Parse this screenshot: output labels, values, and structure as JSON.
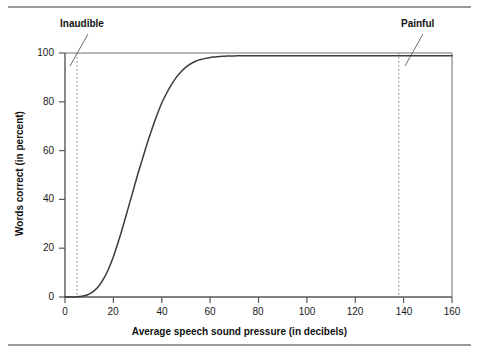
{
  "figure": {
    "background_color": "#ffffff",
    "rule_color": "#9a9a9a",
    "axis_color": "#595959",
    "curve_color": "#3b3b3b",
    "dashed_color": "#9a9a9a"
  },
  "chart_data": {
    "type": "line",
    "title": "",
    "xlabel": "Average speech sound pressure (in decibels)",
    "ylabel": "Words correct (in percent)",
    "xlim": [
      0,
      160
    ],
    "ylim": [
      0,
      100
    ],
    "grid": false,
    "legend": "none",
    "xticks": [
      0,
      20,
      40,
      60,
      80,
      100,
      120,
      140,
      160
    ],
    "xtick_labels": [
      "0",
      "20",
      "40",
      "60",
      "80",
      "100",
      "120",
      "140",
      "160"
    ],
    "yticks": [
      0,
      20,
      40,
      60,
      80,
      100
    ],
    "ytick_labels": [
      "0",
      "20",
      "40",
      "60",
      "80",
      "100"
    ],
    "series": [
      {
        "name": "Speech intelligibility",
        "x": [
          0,
          2,
          4,
          6,
          8,
          10,
          12,
          14,
          16,
          18,
          20,
          22,
          24,
          26,
          28,
          30,
          32,
          34,
          36,
          38,
          40,
          42,
          44,
          46,
          48,
          50,
          52,
          54,
          56,
          58,
          60,
          62,
          64,
          66,
          68,
          70,
          72,
          74,
          76,
          78,
          80,
          90,
          100,
          110,
          120,
          130,
          138,
          140,
          150,
          160
        ],
        "y": [
          0,
          0,
          0,
          0.2,
          0.5,
          1.2,
          2.5,
          4.5,
          7.5,
          11.5,
          16.5,
          22.5,
          29,
          36,
          43,
          50,
          56.5,
          63,
          69,
          74.5,
          79.5,
          83.5,
          87,
          90,
          92.3,
          94.2,
          95.6,
          96.6,
          97.3,
          97.8,
          98.2,
          98.4,
          98.6,
          98.7,
          98.8,
          98.8,
          98.9,
          98.9,
          98.9,
          98.9,
          98.9,
          98.9,
          98.9,
          98.9,
          98.9,
          98.9,
          98.9,
          98.9,
          98.9,
          98.9
        ]
      }
    ],
    "annotations": [
      {
        "label": "Inaudible",
        "x": 5,
        "style": "dashed-vertical"
      },
      {
        "label": "Painful",
        "x": 138,
        "style": "dashed-vertical"
      }
    ]
  }
}
